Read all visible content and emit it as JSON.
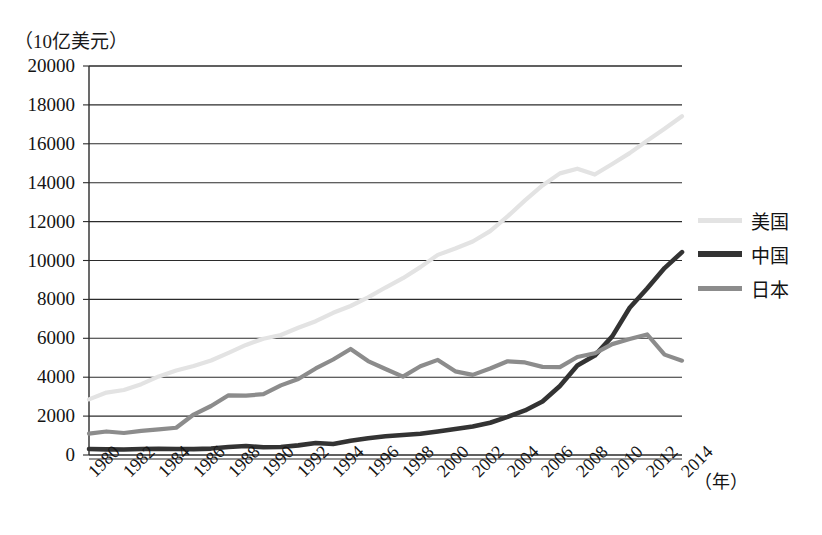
{
  "chart_data": {
    "type": "line",
    "title": "",
    "ylabel": "（10亿美元）",
    "xlabel": "（年）",
    "ylim": [
      0,
      20000
    ],
    "ytick_step": 2000,
    "yticks": [
      "0",
      "2000",
      "4000",
      "6000",
      "8000",
      "10000",
      "12000",
      "14000",
      "16000",
      "18000",
      "20000"
    ],
    "xlim": [
      1980,
      2014
    ],
    "xticks": [
      "1980",
      "1982",
      "1984",
      "1986",
      "1988",
      "1990",
      "1992",
      "1994",
      "1996",
      "1998",
      "2000",
      "2002",
      "2004",
      "2006",
      "2008",
      "2010",
      "2012",
      "2014"
    ],
    "x": [
      1980,
      1981,
      1982,
      1983,
      1984,
      1985,
      1986,
      1987,
      1988,
      1989,
      1990,
      1991,
      1992,
      1993,
      1994,
      1995,
      1996,
      1997,
      1998,
      1999,
      2000,
      2001,
      2002,
      2003,
      2004,
      2005,
      2006,
      2007,
      2008,
      2009,
      2010,
      2011,
      2012,
      2013,
      2014
    ],
    "grid": true,
    "grid_axis": "y",
    "legend_position": "right",
    "series": [
      {
        "name": "美国",
        "color": "#e3e3e3",
        "values": [
          2860,
          3210,
          3340,
          3640,
          4040,
          4340,
          4580,
          4860,
          5250,
          5660,
          5980,
          6170,
          6540,
          6880,
          7310,
          7660,
          8100,
          8610,
          9090,
          9660,
          10290,
          10620,
          10980,
          11510,
          12270,
          13090,
          13860,
          14480,
          14720,
          14420,
          14960,
          15520,
          16160,
          16770,
          17420
        ]
      },
      {
        "name": "中国",
        "color": "#333333",
        "values": [
          305,
          290,
          285,
          305,
          315,
          310,
          300,
          330,
          410,
          460,
          400,
          410,
          495,
          620,
          565,
          735,
          865,
          960,
          1030,
          1090,
          1210,
          1340,
          1470,
          1660,
          1960,
          2290,
          2750,
          3550,
          4600,
          5110,
          6100,
          7570,
          8560,
          9610,
          10430
        ]
      },
      {
        "name": "日本",
        "color": "#8c8c8c",
        "values": [
          1100,
          1210,
          1130,
          1240,
          1320,
          1400,
          2080,
          2520,
          3070,
          3050,
          3130,
          3580,
          3910,
          4450,
          4910,
          5450,
          4830,
          4420,
          4030,
          4560,
          4890,
          4300,
          4120,
          4450,
          4820,
          4760,
          4530,
          4520,
          5040,
          5230,
          5700,
          5960,
          6200,
          5160,
          4850
        ]
      }
    ]
  },
  "legend": {
    "items": [
      {
        "label": "美国"
      },
      {
        "label": "中国"
      },
      {
        "label": "日本"
      }
    ]
  }
}
